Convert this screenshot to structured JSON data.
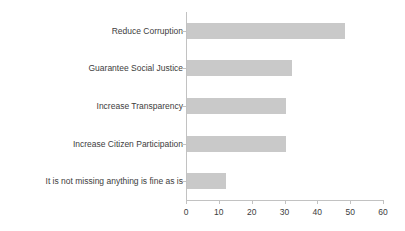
{
  "chart_data": {
    "type": "bar",
    "orientation": "horizontal",
    "title": "",
    "subtitle": "",
    "xlabel": "",
    "ylabel": "",
    "categories": [
      "Reduce Corruption",
      "Guarantee Social Justice",
      "Increase Transparency",
      "Increase Citizen Participation",
      "It is not missing anything is fine as is"
    ],
    "values": [
      48,
      32,
      30,
      30,
      12
    ],
    "xlim": [
      0,
      60
    ],
    "xticks": [
      0,
      10,
      20,
      30,
      40,
      50,
      60
    ],
    "xtick_labels": [
      "0",
      "10",
      "20",
      "30",
      "40",
      "50",
      "60"
    ],
    "grid": false,
    "legend": false,
    "legend_position": "none",
    "bar_color": "#c9c9c9",
    "axis_color": "#c2c2c2",
    "text_color": "#3d3d3d",
    "background_color": "#ffffff"
  }
}
